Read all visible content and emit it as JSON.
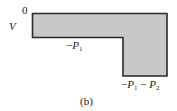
{
  "figure": {
    "caption": "(b)",
    "axis_label": "V",
    "labels": {
      "zero": "0",
      "level1": {
        "sign": "−",
        "var": "P",
        "sub": "1"
      },
      "level2": {
        "sign1": "−",
        "var1": "P",
        "sub1": "1",
        "sign2": " − ",
        "var2": "P",
        "sub2": "2"
      }
    },
    "colors": {
      "fill": "#c8c8c8",
      "stroke": "#2a2a2a"
    }
  }
}
